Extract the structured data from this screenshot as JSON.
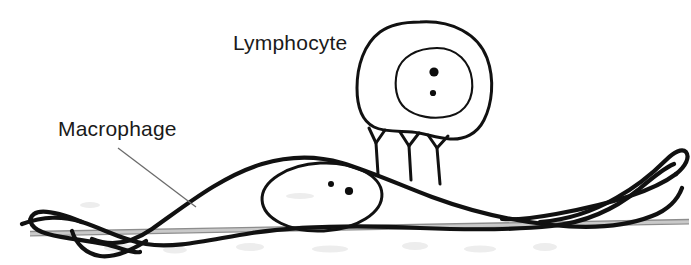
{
  "figure": {
    "background_color": "#ffffff",
    "ink_color": "#111111",
    "substrate_color": "#8d8d8d",
    "leader_color": "#6b6b6b",
    "width": 691,
    "height": 265
  },
  "labels": {
    "lymphocyte": {
      "text": "Lymphocyte",
      "x": 233,
      "y": 50,
      "font_size": 21
    },
    "macrophage": {
      "text": "Macrophage",
      "x": 58,
      "y": 136,
      "font_size": 21
    }
  },
  "lymphocyte": {
    "name": "lymphocyte-cell",
    "outer_membrane_bounds": {
      "x": 358,
      "y": 22,
      "width": 132,
      "height": 110
    },
    "nucleus_bounds": {
      "x": 396,
      "y": 48,
      "width": 76,
      "height": 68
    },
    "nucleoli": [
      {
        "cx": 434,
        "cy": 72,
        "r": 4.6,
        "label": "nucleolus-large"
      },
      {
        "cx": 433,
        "cy": 93,
        "r": 3.1,
        "label": "nucleolus-small"
      }
    ],
    "pseudopods": [
      {
        "label": "pseudopod-left",
        "top_y": 130,
        "bottom_y": 174,
        "x": 375
      },
      {
        "label": "pseudopod-center",
        "top_y": 130,
        "bottom_y": 174,
        "x": 411
      },
      {
        "label": "pseudopod-right",
        "top_y": 130,
        "bottom_y": 174,
        "x": 438
      }
    ]
  },
  "macrophage": {
    "name": "macrophage-cell",
    "body_peak": {
      "x": 300,
      "y": 158
    },
    "nucleus_bounds": {
      "x": 262,
      "y": 163,
      "width": 120,
      "height": 68
    },
    "nucleoli": [
      {
        "cx": 331,
        "cy": 184,
        "r": 3.0,
        "label": "nucleolus-small"
      },
      {
        "cx": 349,
        "cy": 191,
        "r": 4.1,
        "label": "nucleolus-large"
      }
    ]
  },
  "substrate": {
    "name": "substrate-surface",
    "left_x": 30,
    "right_x": 689,
    "left_y": 233,
    "right_y": 222
  },
  "leader": {
    "name": "macrophage-leader-line",
    "from": {
      "x": 118,
      "y": 148
    },
    "to": {
      "x": 196,
      "y": 207
    }
  },
  "icons": {
    "lymphocyte_icon": "cell-icon",
    "macrophage_icon": "cell-icon"
  }
}
